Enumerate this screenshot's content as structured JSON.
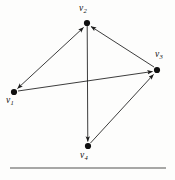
{
  "figure": {
    "kind": "directed-graph-diagram",
    "width": 175,
    "height": 180,
    "background_color": "#fdfdfc",
    "ink_color": "#1a1a1a",
    "rule_color": "#8a8a8a"
  },
  "graph": {
    "vertices": [
      {
        "id": "v1",
        "label": "v",
        "subscript": "1",
        "x": 14,
        "y": 92,
        "label_x": 6,
        "label_y": 96,
        "dot_radius": 3.1
      },
      {
        "id": "v2",
        "label": "v",
        "subscript": "2",
        "x": 87,
        "y": 23,
        "label_x": 79,
        "label_y": 4,
        "dot_radius": 3.1
      },
      {
        "id": "v3",
        "label": "v",
        "subscript": "3",
        "x": 157,
        "y": 70,
        "label_x": 155,
        "label_y": 50,
        "dot_radius": 3.1
      },
      {
        "id": "v4",
        "label": "v",
        "subscript": "4",
        "x": 88,
        "y": 146,
        "label_x": 80,
        "label_y": 151,
        "dot_radius": 3.1
      }
    ],
    "edges": [
      {
        "id": "e-v1-v2",
        "from": "v1",
        "to": "v2",
        "arrow": "both",
        "description": "bidirectional edge between v1 and v2"
      },
      {
        "id": "e-v1-v3",
        "from": "v1",
        "to": "v3",
        "arrow": "end",
        "description": "long near-horizontal edge from v1 to v3"
      },
      {
        "id": "e-v3-v2",
        "from": "v3",
        "to": "v2",
        "arrow": "end",
        "description": "edge from v3 up-left to v2"
      },
      {
        "id": "e-v2-v4",
        "from": "v2",
        "to": "v4",
        "arrow": "end",
        "description": "vertical edge from v2 down to v4"
      },
      {
        "id": "e-v4-v3",
        "from": "v4",
        "to": "v3",
        "arrow": "end",
        "description": "edge from v4 up-right to v3"
      }
    ]
  },
  "rule": {
    "x1": 10,
    "x2": 166,
    "y": 168,
    "thickness": 1.6
  }
}
